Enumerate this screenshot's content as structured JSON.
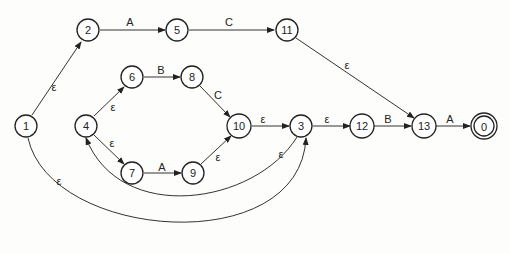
{
  "diagram": {
    "type": "nfa-state-graph",
    "nodes": [
      {
        "id": "1",
        "label": "1",
        "x": 26,
        "y": 126
      },
      {
        "id": "2",
        "label": "2",
        "x": 88,
        "y": 30
      },
      {
        "id": "5",
        "label": "5",
        "x": 177,
        "y": 30
      },
      {
        "id": "11",
        "label": "11",
        "x": 287,
        "y": 30
      },
      {
        "id": "6",
        "label": "6",
        "x": 132,
        "y": 77
      },
      {
        "id": "8",
        "label": "8",
        "x": 192,
        "y": 77
      },
      {
        "id": "4",
        "label": "4",
        "x": 86,
        "y": 126
      },
      {
        "id": "10",
        "label": "10",
        "x": 239,
        "y": 126
      },
      {
        "id": "3",
        "label": "3",
        "x": 301,
        "y": 126
      },
      {
        "id": "12",
        "label": "12",
        "x": 362,
        "y": 126
      },
      {
        "id": "13",
        "label": "13",
        "x": 424,
        "y": 126
      },
      {
        "id": "0",
        "label": "0",
        "x": 484,
        "y": 126,
        "accepting": true
      },
      {
        "id": "7",
        "label": "7",
        "x": 132,
        "y": 173
      },
      {
        "id": "9",
        "label": "9",
        "x": 193,
        "y": 173
      }
    ],
    "edges": [
      {
        "from": "1",
        "to": "2",
        "label": "ε"
      },
      {
        "from": "2",
        "to": "5",
        "label": "A"
      },
      {
        "from": "5",
        "to": "11",
        "label": "C"
      },
      {
        "from": "11",
        "to": "13",
        "label": "ε"
      },
      {
        "from": "4",
        "to": "6",
        "label": "ε"
      },
      {
        "from": "6",
        "to": "8",
        "label": "B"
      },
      {
        "from": "8",
        "to": "10",
        "label": "C"
      },
      {
        "from": "4",
        "to": "7",
        "label": "ε"
      },
      {
        "from": "7",
        "to": "9",
        "label": "A"
      },
      {
        "from": "9",
        "to": "10",
        "label": "ε"
      },
      {
        "from": "10",
        "to": "3",
        "label": "ε"
      },
      {
        "from": "3",
        "to": "12",
        "label": "ε"
      },
      {
        "from": "12",
        "to": "13",
        "label": "B"
      },
      {
        "from": "13",
        "to": "0",
        "label": "A"
      },
      {
        "from": "3",
        "to": "4",
        "label": "ε"
      },
      {
        "from": "1",
        "to": "3",
        "label": "ε"
      }
    ]
  }
}
